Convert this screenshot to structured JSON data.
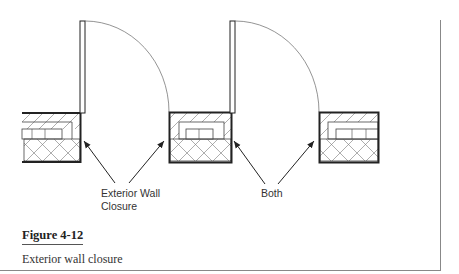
{
  "figure": {
    "number": "Figure 4-12",
    "caption": "Exterior wall closure"
  },
  "callouts": {
    "left": {
      "line1": "Exterior Wall",
      "line2": "Closure"
    },
    "right": {
      "line1": "Both"
    }
  },
  "elements": {
    "walls": [
      "left-wall-section",
      "middle-wall-section",
      "right-wall-section"
    ],
    "doors": [
      "door-1-swing",
      "door-2-swing"
    ]
  },
  "colors": {
    "line": "#222222",
    "thin_line": "#555555",
    "border": "#888888"
  }
}
